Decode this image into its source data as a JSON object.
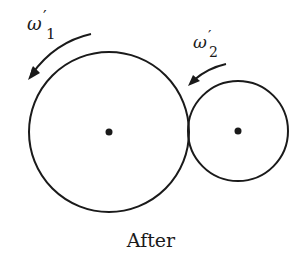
{
  "diagram": {
    "caption": "After",
    "gear_large": {
      "label_symbol": "ω",
      "label_prime": "′",
      "label_subscript": "1",
      "center": [
        109,
        132
      ],
      "radius": 80,
      "rotation_direction": "counterclockwise"
    },
    "gear_small": {
      "label_symbol": "ω",
      "label_prime": "′",
      "label_subscript": "2",
      "center": [
        238,
        131
      ],
      "radius": 50,
      "rotation_direction": "counterclockwise"
    },
    "colors": {
      "stroke": "#1a1a1a",
      "background": "#ffffff"
    }
  }
}
